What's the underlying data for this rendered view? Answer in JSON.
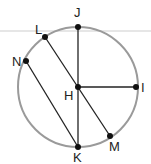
{
  "diagram": {
    "type": "circle-geometry",
    "circle": {
      "cx": 78,
      "cy": 87,
      "r": 60,
      "stroke": "#9a9a9a"
    },
    "guide_line": {
      "y": 31,
      "color": "#e6e6e6"
    },
    "points": [
      {
        "id": "J",
        "label": "J",
        "x": 78,
        "y": 27,
        "lx": 74,
        "ly": 17
      },
      {
        "id": "L",
        "label": "L",
        "x": 45,
        "y": 37,
        "lx": 35,
        "ly": 34
      },
      {
        "id": "N",
        "label": "N",
        "x": 26,
        "y": 61,
        "lx": 12,
        "ly": 66
      },
      {
        "id": "H",
        "label": "H",
        "x": 78,
        "y": 87,
        "lx": 64,
        "ly": 100
      },
      {
        "id": "I",
        "label": "I",
        "x": 136,
        "y": 87,
        "lx": 141,
        "ly": 92
      },
      {
        "id": "K",
        "label": "K",
        "x": 78,
        "y": 147,
        "lx": 73,
        "ly": 162
      },
      {
        "id": "M",
        "label": "M",
        "x": 110,
        "y": 136,
        "lx": 109,
        "ly": 151
      }
    ],
    "segments": [
      {
        "from": "J",
        "to": "K"
      },
      {
        "from": "H",
        "to": "I"
      },
      {
        "from": "L",
        "to": "M"
      },
      {
        "from": "N",
        "to": "K"
      }
    ],
    "colors": {
      "line": "#222222",
      "point": "#111111"
    }
  },
  "labels": {
    "J": "J",
    "L": "L",
    "N": "N",
    "H": "H",
    "I": "I",
    "K": "K",
    "M": "M"
  }
}
